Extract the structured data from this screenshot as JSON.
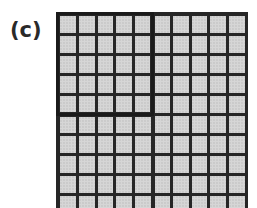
{
  "figure": {
    "label": "(c)",
    "grid": {
      "columns": 10,
      "visible_rows": 10,
      "highlighted_block": {
        "rows": 5,
        "columns": 5,
        "position": "top-left"
      },
      "cell_color": "#d6d6d6",
      "line_color": "#262626"
    }
  }
}
